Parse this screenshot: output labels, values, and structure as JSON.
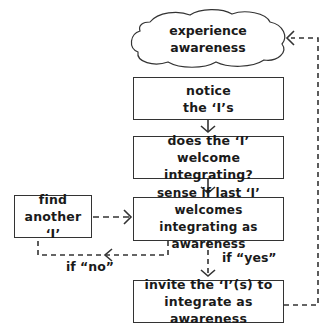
{
  "diagram": {
    "cloud": {
      "line1": "experience",
      "line2": "awareness"
    },
    "nodes": [
      {
        "id": "notice",
        "line1": "notice",
        "line2": "the ‘I’s"
      },
      {
        "id": "does",
        "line1": "does the ‘I’ welcome",
        "line2": "integrating?"
      },
      {
        "id": "sense",
        "line1": "sense if last ‘I’ welcomes",
        "line2": "integrating as awareness"
      },
      {
        "id": "find",
        "line1": "find",
        "line2": "another ‘I’"
      },
      {
        "id": "invite",
        "line1": "invite the ‘I’(s) to",
        "line2": "integrate as awareness"
      }
    ],
    "edge_labels": {
      "yes": "if “yes”",
      "no": "if “no”"
    },
    "colors": {
      "stroke": "#333333",
      "text": "#1a1a1a",
      "background": "#ffffff"
    }
  }
}
